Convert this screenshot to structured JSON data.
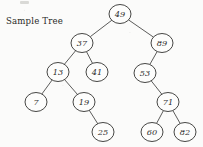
{
  "figure": {
    "caption": "Sample Tree",
    "width": 203,
    "height": 147,
    "background_color": "#fbfbfa",
    "stroke_color": "#3c3c3a",
    "text_color": "#2e2e2c"
  },
  "chart_data": {
    "type": "diagram",
    "diagram_type": "binary-search-tree",
    "title": "Sample Tree",
    "root": 49,
    "node_count": 12,
    "depth": 5,
    "nodes": [
      {
        "id": "n49",
        "label": "49",
        "value": 49,
        "cx": 120,
        "cy": 14,
        "rx": 11,
        "ry": 9.5,
        "level": 1
      },
      {
        "id": "n37",
        "label": "37",
        "value": 37,
        "cx": 82,
        "cy": 43,
        "rx": 11,
        "ry": 9.5,
        "level": 2
      },
      {
        "id": "n89",
        "label": "89",
        "value": 89,
        "cx": 162,
        "cy": 43,
        "rx": 11,
        "ry": 9.5,
        "level": 2
      },
      {
        "id": "n13",
        "label": "13",
        "value": 13,
        "cx": 58,
        "cy": 72,
        "rx": 11,
        "ry": 9.5,
        "level": 3
      },
      {
        "id": "n41",
        "label": "41",
        "value": 41,
        "cx": 97,
        "cy": 72,
        "rx": 11,
        "ry": 9.5,
        "level": 3
      },
      {
        "id": "n53",
        "label": "53",
        "value": 53,
        "cx": 145,
        "cy": 73,
        "rx": 11,
        "ry": 9.5,
        "level": 3
      },
      {
        "id": "n7",
        "label": "7",
        "value": 7,
        "cx": 36,
        "cy": 102,
        "rx": 11,
        "ry": 9.5,
        "level": 4
      },
      {
        "id": "n19",
        "label": "19",
        "value": 19,
        "cx": 84,
        "cy": 102,
        "rx": 11,
        "ry": 9.5,
        "level": 4
      },
      {
        "id": "n71",
        "label": "71",
        "value": 71,
        "cx": 168,
        "cy": 102,
        "rx": 11,
        "ry": 9.5,
        "level": 4
      },
      {
        "id": "n25",
        "label": "25",
        "value": 25,
        "cx": 103,
        "cy": 132,
        "rx": 11,
        "ry": 9.5,
        "level": 5
      },
      {
        "id": "n60",
        "label": "60",
        "value": 60,
        "cx": 152,
        "cy": 132,
        "rx": 11,
        "ry": 9.5,
        "level": 5
      },
      {
        "id": "n82",
        "label": "82",
        "value": 82,
        "cx": 185,
        "cy": 132,
        "rx": 11,
        "ry": 9.5,
        "level": 5
      }
    ],
    "edges": [
      {
        "from": "n49",
        "to": "n37",
        "side": "left"
      },
      {
        "from": "n49",
        "to": "n89",
        "side": "right"
      },
      {
        "from": "n37",
        "to": "n13",
        "side": "left"
      },
      {
        "from": "n37",
        "to": "n41",
        "side": "right"
      },
      {
        "from": "n13",
        "to": "n7",
        "side": "left"
      },
      {
        "from": "n13",
        "to": "n19",
        "side": "right"
      },
      {
        "from": "n19",
        "to": "n25",
        "side": "right"
      },
      {
        "from": "n89",
        "to": "n53",
        "side": "left"
      },
      {
        "from": "n53",
        "to": "n71",
        "side": "right"
      },
      {
        "from": "n71",
        "to": "n60",
        "side": "left"
      },
      {
        "from": "n71",
        "to": "n82",
        "side": "right"
      }
    ]
  }
}
